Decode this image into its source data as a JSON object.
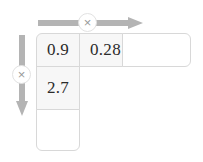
{
  "figure": {
    "type": "multiplication-grid",
    "top_arrow": {
      "label": "×",
      "direction": "right",
      "color": "#b4b4b4"
    },
    "left_arrow": {
      "label": "×",
      "direction": "down",
      "color": "#b4b4b4"
    },
    "grid": {
      "shape": "L",
      "fill_color": "#f7f7f7",
      "border_color": "#d8d8d8",
      "top_row": [
        {
          "value": "0.9",
          "filled": true
        },
        {
          "value": "0.28",
          "filled": true
        },
        {
          "value": "",
          "filled": false
        }
      ],
      "left_column_rest": [
        {
          "value": "2.7",
          "filled": true
        },
        {
          "value": "",
          "filled": false
        }
      ]
    }
  }
}
